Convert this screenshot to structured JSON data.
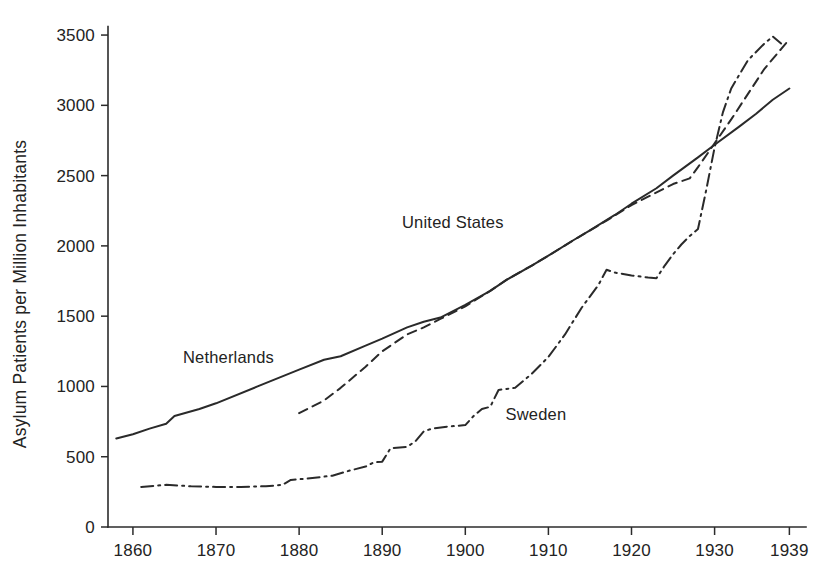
{
  "chart_data": {
    "type": "line",
    "title": "",
    "xlabel": "",
    "ylabel": "Asylum Patients per Million Inhabitants",
    "xlim": [
      1857,
      1941
    ],
    "ylim": [
      0,
      3600
    ],
    "xticks": [
      1860,
      1870,
      1880,
      1890,
      1900,
      1910,
      1920,
      1930,
      1939
    ],
    "xticklabels": [
      "1860",
      "1870",
      "1880",
      "1890",
      "1900",
      "1910",
      "1920",
      "1930",
      "1939"
    ],
    "yticks": [
      0,
      500,
      1000,
      1500,
      2000,
      2500,
      3000,
      3500
    ],
    "yticklabels": [
      "0",
      "500",
      "1000",
      "1500",
      "2000",
      "2500",
      "3000",
      "3500"
    ],
    "grid": false,
    "legend_position": "inline-annotations",
    "series": [
      {
        "name": "Netherlands",
        "style": "solid",
        "color": "#2a2a2a",
        "label_x": 1871.5,
        "label_y": 1170,
        "points": [
          [
            1858,
            630
          ],
          [
            1860,
            660
          ],
          [
            1862,
            700
          ],
          [
            1864,
            735
          ],
          [
            1865,
            790
          ],
          [
            1868,
            840
          ],
          [
            1870,
            880
          ],
          [
            1875,
            1000
          ],
          [
            1880,
            1120
          ],
          [
            1883,
            1190
          ],
          [
            1885,
            1215
          ],
          [
            1888,
            1290
          ],
          [
            1890,
            1340
          ],
          [
            1893,
            1420
          ],
          [
            1895,
            1460
          ],
          [
            1897,
            1490
          ],
          [
            1900,
            1580
          ],
          [
            1903,
            1680
          ],
          [
            1905,
            1760
          ],
          [
            1908,
            1860
          ],
          [
            1910,
            1930
          ],
          [
            1913,
            2040
          ],
          [
            1915,
            2110
          ],
          [
            1918,
            2220
          ],
          [
            1920,
            2300
          ],
          [
            1923,
            2410
          ],
          [
            1925,
            2500
          ],
          [
            1928,
            2630
          ],
          [
            1930,
            2720
          ],
          [
            1933,
            2850
          ],
          [
            1935,
            2940
          ],
          [
            1937,
            3040
          ],
          [
            1939,
            3120
          ]
        ]
      },
      {
        "name": "United States",
        "style": "dashed",
        "color": "#2a2a2a",
        "label_x": 1898.5,
        "label_y": 2130,
        "points": [
          [
            1880,
            810
          ],
          [
            1883,
            900
          ],
          [
            1885,
            990
          ],
          [
            1888,
            1140
          ],
          [
            1890,
            1250
          ],
          [
            1893,
            1370
          ],
          [
            1895,
            1420
          ],
          [
            1897,
            1480
          ],
          [
            1900,
            1570
          ],
          [
            1903,
            1680
          ],
          [
            1905,
            1760
          ],
          [
            1908,
            1860
          ],
          [
            1910,
            1930
          ],
          [
            1913,
            2040
          ],
          [
            1915,
            2110
          ],
          [
            1917,
            2180
          ],
          [
            1920,
            2290
          ],
          [
            1922,
            2350
          ],
          [
            1925,
            2440
          ],
          [
            1927,
            2480
          ],
          [
            1928,
            2560
          ],
          [
            1930,
            2730
          ],
          [
            1932,
            2900
          ],
          [
            1934,
            3080
          ],
          [
            1936,
            3260
          ],
          [
            1938,
            3400
          ],
          [
            1939,
            3470
          ]
        ]
      },
      {
        "name": "Sweden",
        "style": "dashdot",
        "color": "#2a2a2a",
        "label_x": 1908.5,
        "label_y": 760,
        "points": [
          [
            1861,
            285
          ],
          [
            1864,
            300
          ],
          [
            1867,
            290
          ],
          [
            1870,
            285
          ],
          [
            1873,
            285
          ],
          [
            1876,
            290
          ],
          [
            1878,
            300
          ],
          [
            1879,
            335
          ],
          [
            1881,
            345
          ],
          [
            1884,
            365
          ],
          [
            1886,
            400
          ],
          [
            1888,
            430
          ],
          [
            1889,
            460
          ],
          [
            1890,
            465
          ],
          [
            1891,
            560
          ],
          [
            1893,
            570
          ],
          [
            1894,
            610
          ],
          [
            1895,
            680
          ],
          [
            1896,
            700
          ],
          [
            1898,
            715
          ],
          [
            1900,
            725
          ],
          [
            1901,
            790
          ],
          [
            1902,
            840
          ],
          [
            1903,
            855
          ],
          [
            1904,
            975
          ],
          [
            1906,
            990
          ],
          [
            1908,
            1090
          ],
          [
            1910,
            1210
          ],
          [
            1912,
            1370
          ],
          [
            1914,
            1560
          ],
          [
            1916,
            1720
          ],
          [
            1917,
            1830
          ],
          [
            1918,
            1810
          ],
          [
            1920,
            1790
          ],
          [
            1922,
            1775
          ],
          [
            1923,
            1770
          ],
          [
            1924,
            1860
          ],
          [
            1925,
            1940
          ],
          [
            1926,
            2010
          ],
          [
            1927,
            2070
          ],
          [
            1928,
            2120
          ],
          [
            1929,
            2400
          ],
          [
            1930,
            2700
          ],
          [
            1931,
            2950
          ],
          [
            1932,
            3120
          ],
          [
            1934,
            3320
          ],
          [
            1936,
            3440
          ],
          [
            1937,
            3490
          ],
          [
            1938,
            3440
          ]
        ]
      }
    ]
  },
  "annotations": {
    "netherlands": "Netherlands",
    "united_states": "United States",
    "sweden": "Sweden"
  }
}
